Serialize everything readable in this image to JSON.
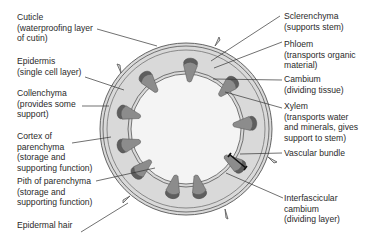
{
  "diagram": {
    "colors": {
      "cortex": "#d9d9d9",
      "pith": "#f4f4f4",
      "outline": "#555555",
      "phloem": "#8c8c8c",
      "xylem": "#5e5e5e",
      "leader": "#333333"
    },
    "labels_left": [
      {
        "id": "cuticle",
        "lines": [
          "Cuticle",
          "(waterproofing layer",
          "of cutin)"
        ]
      },
      {
        "id": "epidermis",
        "lines": [
          "Epidermis",
          "(single cell layer)"
        ]
      },
      {
        "id": "collenchyma",
        "lines": [
          "Collenchyma",
          "(provides some",
          "support)"
        ]
      },
      {
        "id": "cortex",
        "lines": [
          "Cortex of",
          "parenchyma",
          "(storage and",
          "supporting function)"
        ]
      },
      {
        "id": "pith",
        "lines": [
          "Pith of parenchyma",
          "(storage and",
          "supporting function)"
        ]
      },
      {
        "id": "epidermal-hair",
        "lines": [
          "Epidermal hair"
        ]
      }
    ],
    "labels_right": [
      {
        "id": "sclerenchyma",
        "lines": [
          "Sclerenchyma",
          "(supports stem)"
        ]
      },
      {
        "id": "phloem",
        "lines": [
          "Phloem",
          "(transports organic",
          "material)"
        ]
      },
      {
        "id": "cambium",
        "lines": [
          "Cambium",
          "(dividing tissue)"
        ]
      },
      {
        "id": "xylem",
        "lines": [
          "Xylem",
          "(transports water",
          "and minerals, gives",
          "support to stem)"
        ]
      },
      {
        "id": "vascular-bundle",
        "lines": [
          "Vascular bundle"
        ]
      },
      {
        "id": "interfascicular-cambium",
        "lines": [
          "Interfascicular",
          "cambium",
          "(dividing layer)"
        ]
      }
    ]
  }
}
